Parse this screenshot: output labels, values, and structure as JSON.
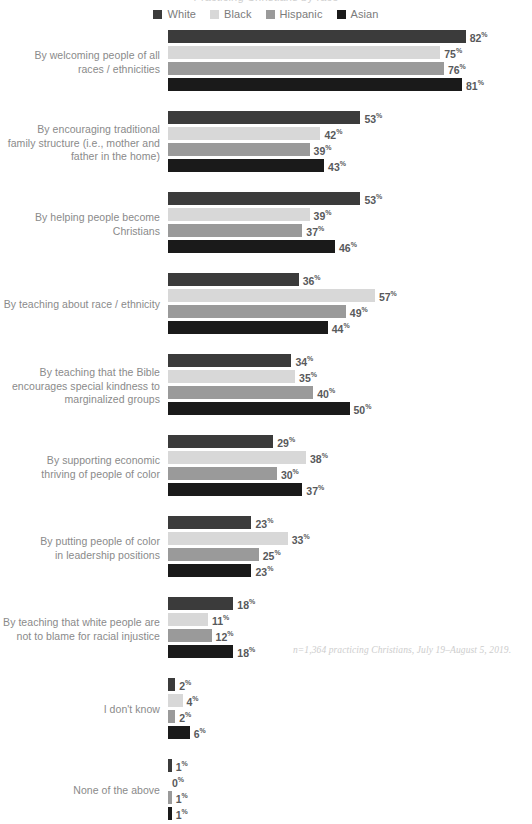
{
  "title": "Practicing Christians by race",
  "legend": {
    "position": "top-center",
    "items": [
      {
        "label": "White",
        "color": "#3b3b3b"
      },
      {
        "label": "Black",
        "color": "#d8d8d8"
      },
      {
        "label": "Hispanic",
        "color": "#9a9a9a"
      },
      {
        "label": "Asian",
        "color": "#1a1a1a"
      }
    ]
  },
  "footnote": "n=1,364 practicing Christians, July 19–August 5, 2019.",
  "percent_symbol": "%",
  "chart_data": {
    "type": "bar",
    "orientation": "horizontal",
    "title": "Practicing Christians by race",
    "xlabel": "",
    "ylabel": "",
    "xlim": [
      0,
      82
    ],
    "grid": false,
    "legend_position": "top-center",
    "value_suffix": "%",
    "categories": [
      "By welcoming people of all races / ethnicities",
      "By encouraging traditional family structure (i.e., mother and father in the home)",
      "By helping people become Christians",
      "By teaching about race / ethnicity",
      "By teaching that the Bible encourages special kindness to marginalized groups",
      "By supporting economic thriving of people of color",
      "By putting people of color in leadership positions",
      "By teaching that white people are not to blame for racial injustice",
      "I don't know",
      "None of the above"
    ],
    "series": [
      {
        "name": "White",
        "color": "#3b3b3b",
        "values": [
          82,
          53,
          53,
          36,
          34,
          29,
          23,
          18,
          2,
          1
        ]
      },
      {
        "name": "Black",
        "color": "#d8d8d8",
        "values": [
          75,
          42,
          39,
          57,
          35,
          38,
          33,
          11,
          4,
          0
        ]
      },
      {
        "name": "Hispanic",
        "color": "#9a9a9a",
        "values": [
          76,
          39,
          37,
          49,
          40,
          30,
          25,
          12,
          2,
          1
        ]
      },
      {
        "name": "Asian",
        "color": "#1a1a1a",
        "values": [
          81,
          43,
          46,
          44,
          50,
          37,
          23,
          18,
          6,
          1
        ]
      }
    ]
  },
  "groups": [
    {
      "label_lines": [
        "By welcoming people of all",
        "races / ethnicities"
      ]
    },
    {
      "label_lines": [
        "By encouraging traditional",
        "family structure (i.e., mother and",
        "father in the home)"
      ]
    },
    {
      "label_lines": [
        "By helping people become",
        "Christians"
      ]
    },
    {
      "label_lines": [
        "By teaching about race / ethnicity"
      ]
    },
    {
      "label_lines": [
        "By teaching that the Bible",
        "encourages special kindness to",
        "marginalized groups"
      ]
    },
    {
      "label_lines": [
        "By supporting economic",
        "thriving of people of color"
      ]
    },
    {
      "label_lines": [
        "By putting people of color",
        "in leadership positions"
      ]
    },
    {
      "label_lines": [
        "By teaching that white people are",
        "not to blame for racial injustice"
      ]
    },
    {
      "label_lines": [
        "I don't know"
      ]
    },
    {
      "label_lines": [
        "None of the above"
      ]
    }
  ]
}
